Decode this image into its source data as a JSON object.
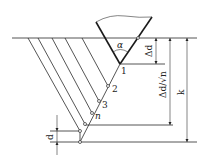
{
  "diagram": {
    "type": "cutting-layer-schematic",
    "labels": {
      "angle": "α",
      "delta_d": "Δd",
      "delta_d_over_sqrt_n": "Δd/√n",
      "k": "k",
      "d": "d",
      "pass_1": "1",
      "pass_2": "2",
      "pass_3": "3",
      "pass_n": "n"
    },
    "colors": {
      "line": "#2a2a2a",
      "background": "#ffffff"
    }
  }
}
